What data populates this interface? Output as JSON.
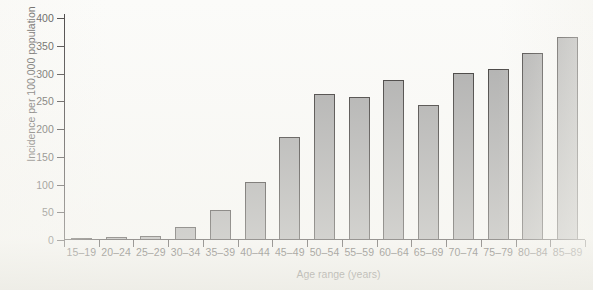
{
  "chart_data": {
    "type": "bar",
    "title": "",
    "xlabel": "Age range (years)",
    "ylabel": "Incidence per 100,000 population",
    "categories": [
      "15–19",
      "20–24",
      "25–29",
      "30–34",
      "35–39",
      "40–44",
      "45–49",
      "50–54",
      "55–59",
      "60–64",
      "65–69",
      "70–74",
      "75–79",
      "80–84",
      "85–89"
    ],
    "values": [
      1,
      3,
      6,
      22,
      53,
      103,
      184,
      261,
      255,
      287,
      241,
      299,
      306,
      336,
      364
    ],
    "ylim": [
      0,
      400
    ],
    "ytick_values": [
      0,
      50,
      100,
      150,
      200,
      250,
      300,
      350,
      400
    ],
    "ytick_labels": [
      "0",
      "50",
      "100",
      "150",
      "200",
      "250",
      "300",
      "350",
      "400"
    ],
    "grid": false,
    "legend": false,
    "legend_position": "none",
    "bar_color": "#a9a9a9",
    "bar_edge_color": "#2f2c2b",
    "axis_color": "#231f20",
    "background_color": "#fbfbf9"
  }
}
